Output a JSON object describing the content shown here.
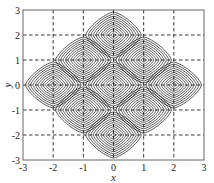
{
  "chart_data": {
    "type": "contour",
    "title": "",
    "xlabel": "x",
    "ylabel": "y",
    "xlim": [
      -3,
      3
    ],
    "ylim": [
      -3,
      3
    ],
    "xticks": [
      -3,
      -2,
      -1,
      0,
      1,
      2,
      3
    ],
    "yticks": [
      -3,
      -2,
      -1,
      0,
      1,
      2,
      3
    ],
    "xtick_labels": [
      "-3",
      "-2",
      "-1",
      "0",
      "1",
      "2",
      "3"
    ],
    "ytick_labels": [
      "-3",
      "-2",
      "-1",
      "0",
      "1",
      "2",
      "3"
    ],
    "grid": {
      "on": true,
      "style": "dashed",
      "positions": [
        -2,
        -1,
        0,
        1,
        2
      ]
    },
    "legend": null,
    "contour_centers": [
      {
        "x": 0,
        "y": 2
      },
      {
        "x": -1,
        "y": 1
      },
      {
        "x": 1,
        "y": 1
      },
      {
        "x": -2,
        "y": 0
      },
      {
        "x": 0,
        "y": 0
      },
      {
        "x": 2,
        "y": 0
      },
      {
        "x": -1,
        "y": -1
      },
      {
        "x": 1,
        "y": -1
      },
      {
        "x": 0,
        "y": -2
      }
    ],
    "contour_levels_per_center": 11,
    "lobe_half_width": 0.92,
    "line_color": "#111111",
    "grid_color": "#222222"
  }
}
